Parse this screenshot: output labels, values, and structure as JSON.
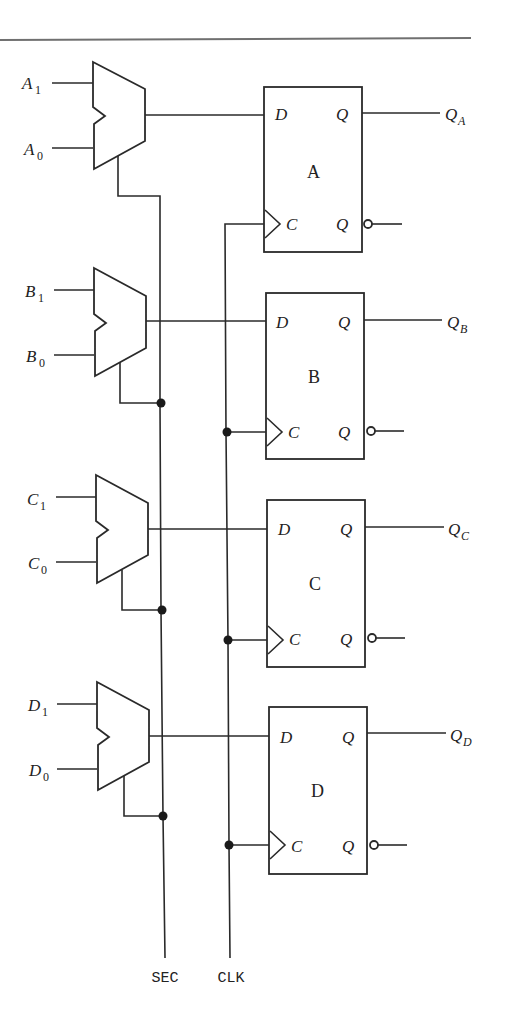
{
  "diagram": {
    "type": "4-bit register with 2-to-1 multiplexer inputs",
    "colors": {
      "line": "#2a2a2a",
      "rule": "#707070",
      "background": "#ffffff"
    },
    "stages": [
      {
        "name": "A",
        "in1": "A",
        "in1_sub": "1",
        "in0": "A",
        "in0_sub": "0",
        "out": "Q",
        "out_sub": "A",
        "d": "D",
        "c": "C",
        "q": "Q",
        "qbar": "Q"
      },
      {
        "name": "B",
        "in1": "B",
        "in1_sub": "1",
        "in0": "B",
        "in0_sub": "0",
        "out": "Q",
        "out_sub": "B",
        "d": "D",
        "c": "C",
        "q": "Q",
        "qbar": "Q"
      },
      {
        "name": "C",
        "in1": "C",
        "in1_sub": "1",
        "in0": "C",
        "in0_sub": "0",
        "out": "Q",
        "out_sub": "C",
        "d": "D",
        "c": "C",
        "q": "Q",
        "qbar": "Q"
      },
      {
        "name": "D",
        "in1": "D",
        "in1_sub": "1",
        "in0": "D",
        "in0_sub": "0",
        "out": "Q",
        "out_sub": "D",
        "d": "D",
        "c": "C",
        "q": "Q",
        "qbar": "Q"
      }
    ],
    "signals": {
      "select": "SEC",
      "clock": "CLK"
    }
  }
}
